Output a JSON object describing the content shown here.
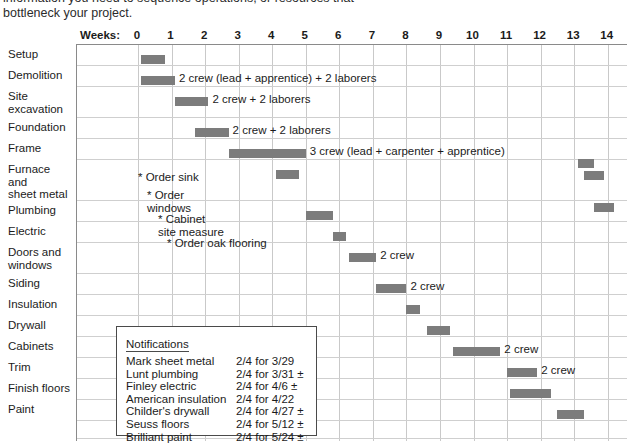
{
  "intro": {
    "line1": "information you need to sequence operations, or resources that",
    "line2": "bottleneck your project."
  },
  "header": {
    "weeks_caption": "Weeks:",
    "week_ticks": [
      "0",
      "1",
      "2",
      "3",
      "4",
      "5",
      "6",
      "7",
      "8",
      "9",
      "10",
      "11",
      "12",
      "13",
      "14"
    ]
  },
  "colors": {
    "bar": "#7c7c7c",
    "grid": "#c9c9c9",
    "frame": "#8a8a8a",
    "text": "#1b1b1b",
    "box_border": "#4a4a4a"
  },
  "rows": [
    {
      "label": [
        "Setup"
      ]
    },
    {
      "label": [
        "Demolition"
      ]
    },
    {
      "label": [
        "Site",
        "excavation"
      ]
    },
    {
      "label": [
        "Foundation"
      ]
    },
    {
      "label": [
        "Frame"
      ]
    },
    {
      "label": [
        "Furnace",
        "and",
        "sheet metal"
      ]
    },
    {
      "label": [
        "Plumbing"
      ]
    },
    {
      "label": [
        "Electric"
      ]
    },
    {
      "label": [
        "Doors and",
        "windows"
      ]
    },
    {
      "label": [
        "Siding"
      ]
    },
    {
      "label": [
        "Insulation"
      ]
    },
    {
      "label": [
        "Drywall"
      ]
    },
    {
      "label": [
        "Cabinets"
      ]
    },
    {
      "label": [
        "Trim"
      ]
    },
    {
      "label": [
        "Finish floors"
      ]
    },
    {
      "label": [
        "Paint"
      ]
    }
  ],
  "annotations": [
    {
      "text": [
        "* Order sink"
      ]
    },
    {
      "text": [
        "* Order",
        "windows"
      ]
    },
    {
      "text": [
        "* Cabinet",
        "site measure"
      ]
    },
    {
      "text": [
        "* Order oak flooring"
      ]
    }
  ],
  "notifications": {
    "title": "Notifications",
    "items": [
      {
        "name": "Mark sheet metal",
        "date": "2/4 for 3/29"
      },
      {
        "name": "Lunt plumbing",
        "date": "2/4 for 3/31 ±"
      },
      {
        "name": "Finley electric",
        "date": "2/4 for 4/6 ±"
      },
      {
        "name": "American insulation",
        "date": "2/4 for 4/22"
      },
      {
        "name": "Childer's drywall",
        "date": "2/4 for 4/27 ±"
      },
      {
        "name": "Seuss floors",
        "date": "2/4 for 5/12 ±"
      },
      {
        "name": "Brilliant paint",
        "date": "2/4 for 5/24 ±"
      }
    ]
  },
  "chart_data": {
    "type": "bar",
    "xlabel": "Weeks:",
    "ylabel": "",
    "xlim": [
      -1.8,
      14.6
    ],
    "grid": true,
    "legend": "none",
    "categories": [
      "Setup",
      "Demolition",
      "Site excavation",
      "Foundation",
      "Frame",
      "Furnace and sheet metal",
      "Plumbing",
      "Electric",
      "Doors and windows",
      "Siding",
      "Insulation",
      "Drywall",
      "Cabinets",
      "Trim",
      "Finish floors",
      "Paint"
    ],
    "tasks": [
      {
        "task": "Setup",
        "start": 0.1,
        "end": 0.8,
        "crew": ""
      },
      {
        "task": "Demolition",
        "start": 0.1,
        "end": 1.1,
        "crew": "2 crew (lead + apprentice) + 2 laborers"
      },
      {
        "task": "Site excavation",
        "start": 1.1,
        "end": 2.1,
        "crew": "2 crew + 2 laborers"
      },
      {
        "task": "Foundation",
        "start": 1.7,
        "end": 2.7,
        "crew": "2 crew + 2 laborers"
      },
      {
        "task": "Frame",
        "start": 2.7,
        "end": 5.0,
        "crew": "3 crew (lead + carpenter + apprentice)"
      },
      {
        "task": "Furnace and sheet metal",
        "start": 4.1,
        "end": 4.8,
        "crew": ""
      },
      {
        "task": "Furnace and sheet metal",
        "start": 13.1,
        "end": 13.6,
        "crew": ""
      },
      {
        "task": "Furnace and sheet metal",
        "start": 13.3,
        "end": 13.9,
        "crew": ""
      },
      {
        "task": "Plumbing",
        "start": 5.0,
        "end": 5.8,
        "crew": ""
      },
      {
        "task": "Plumbing",
        "start": 13.6,
        "end": 14.2,
        "crew": ""
      },
      {
        "task": "Electric",
        "start": 5.8,
        "end": 6.2,
        "crew": ""
      },
      {
        "task": "Doors and windows",
        "start": 6.3,
        "end": 7.1,
        "crew": "2 crew"
      },
      {
        "task": "Siding",
        "start": 7.1,
        "end": 8.0,
        "crew": "2 crew"
      },
      {
        "task": "Insulation",
        "start": 8.0,
        "end": 8.4,
        "crew": ""
      },
      {
        "task": "Drywall",
        "start": 8.6,
        "end": 9.3,
        "crew": ""
      },
      {
        "task": "Cabinets",
        "start": 9.4,
        "end": 10.8,
        "crew": "2 crew"
      },
      {
        "task": "Trim",
        "start": 11.0,
        "end": 11.9,
        "crew": "2 crew"
      },
      {
        "task": "Finish floors",
        "start": 11.1,
        "end": 12.3,
        "crew": ""
      },
      {
        "task": "Paint",
        "start": 12.5,
        "end": 13.3,
        "crew": ""
      }
    ],
    "annotations": [
      {
        "text": "* Order sink",
        "x": 1.0,
        "row": "Furnace and sheet metal"
      },
      {
        "text": "* Order windows",
        "x": 1.2,
        "row": "Furnace and sheet metal"
      },
      {
        "text": "* Cabinet site measure",
        "x": 1.4,
        "row": "Plumbing"
      },
      {
        "text": "* Order oak flooring",
        "x": 1.6,
        "row": "Electric"
      }
    ]
  }
}
